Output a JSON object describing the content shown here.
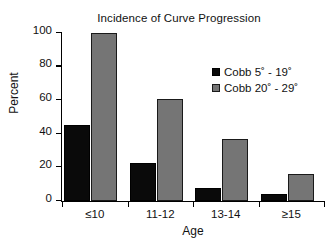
{
  "chart_data": {
    "type": "bar",
    "title": "Incidence of Curve Progression",
    "xlabel": "Age",
    "ylabel": "Percent",
    "categories": [
      "≤10",
      "11-12",
      "13-14",
      "≥15"
    ],
    "series": [
      {
        "name": "Cobb 5˚ - 19˚",
        "color": "#0a0a0a",
        "values": [
          45,
          22.5,
          8,
          4
        ]
      },
      {
        "name": "Cobb 20˚ - 29˚",
        "color": "#757575",
        "values": [
          100,
          61,
          37,
          16
        ]
      }
    ],
    "ylim": [
      0,
      100
    ],
    "yticks": [
      "0",
      "20",
      "40",
      "60",
      "80",
      "100"
    ],
    "ytick_values": [
      0,
      20,
      40,
      60,
      80,
      100
    ],
    "grid": false,
    "legend_position": "upper right inside"
  }
}
